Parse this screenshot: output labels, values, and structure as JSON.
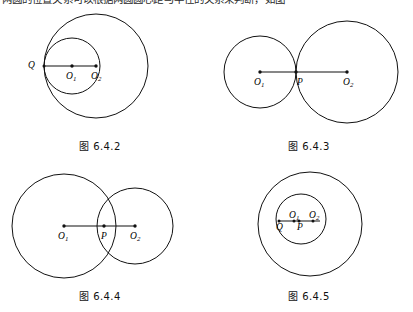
{
  "page": {
    "width": 413,
    "height": 312,
    "background": "#ffffff",
    "stroke_color": "#111111",
    "top_text_clipped": "两圆的位置关系可以根据两圆圆心距与半径的关系来判断，如图"
  },
  "figures": [
    {
      "id": "fig-6-4-2",
      "caption": "图 6.4.2",
      "relation": "internally-tangent",
      "labels": {
        "center1": "O",
        "center1_sub": "1",
        "center2": "O",
        "center2_sub": "2",
        "tangent_point": "Q"
      },
      "circles": [
        {
          "name": "large-circle",
          "cx": 96,
          "cy": 66,
          "r": 52
        },
        {
          "name": "small-circle",
          "cx": 72,
          "cy": 66,
          "r": 28
        }
      ],
      "segment": {
        "x1": 44,
        "y1": 66,
        "x2": 96,
        "y2": 66
      },
      "points": [
        {
          "name": "Q",
          "x": 44,
          "y": 66
        },
        {
          "name": "O1",
          "x": 72,
          "y": 66
        },
        {
          "name": "O2",
          "x": 96,
          "y": 66
        }
      ]
    },
    {
      "id": "fig-6-4-3",
      "caption": "图 6.4.3",
      "relation": "externally-tangent",
      "labels": {
        "center1": "O",
        "center1_sub": "1",
        "center2": "O",
        "center2_sub": "2",
        "tangent_point": "P"
      },
      "circles": [
        {
          "name": "left-circle",
          "cx": 260,
          "cy": 72,
          "r": 36
        },
        {
          "name": "right-circle",
          "cx": 347,
          "cy": 72,
          "r": 51
        }
      ],
      "segment": {
        "x1": 260,
        "y1": 72,
        "x2": 347,
        "y2": 72
      },
      "points": [
        {
          "name": "O1",
          "x": 260,
          "y": 72
        },
        {
          "name": "P",
          "x": 296,
          "y": 72
        },
        {
          "name": "O2",
          "x": 347,
          "y": 72
        }
      ]
    },
    {
      "id": "fig-6-4-4",
      "caption": "图 6.4.4",
      "relation": "intersecting",
      "labels": {
        "center1": "O",
        "center1_sub": "1",
        "center2": "O",
        "center2_sub": "2",
        "intersection_marker": "P"
      },
      "circles": [
        {
          "name": "left-circle",
          "cx": 64,
          "cy": 226,
          "r": 52
        },
        {
          "name": "right-circle",
          "cx": 135,
          "cy": 226,
          "r": 38
        }
      ],
      "segment": {
        "x1": 64,
        "y1": 226,
        "x2": 135,
        "y2": 226
      },
      "points": [
        {
          "name": "O1",
          "x": 64,
          "y": 226
        },
        {
          "name": "P",
          "x": 104,
          "y": 226
        },
        {
          "name": "O2",
          "x": 135,
          "y": 226
        }
      ]
    },
    {
      "id": "fig-6-4-5",
      "caption": "图 6.4.5",
      "relation": "contained",
      "labels": {
        "center1": "O",
        "center1_sub": "1",
        "center2": "O",
        "center2_sub": "2",
        "point_q": "Q",
        "point_p": "P"
      },
      "circles": [
        {
          "name": "outer-circle",
          "cx": 310,
          "cy": 224,
          "r": 52
        },
        {
          "name": "inner-circle",
          "cx": 301,
          "cy": 219,
          "r": 25
        }
      ],
      "segment": {
        "x1": 279,
        "y1": 221,
        "x2": 320,
        "y2": 221
      },
      "points": [
        {
          "name": "Q",
          "x": 279,
          "y": 221
        },
        {
          "name": "P",
          "x": 299,
          "y": 221
        },
        {
          "name": "O1",
          "x": 294,
          "y": 221
        },
        {
          "name": "O2",
          "x": 313,
          "y": 221
        }
      ]
    }
  ]
}
